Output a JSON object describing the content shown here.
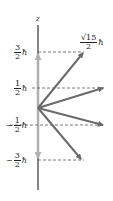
{
  "diagram": {
    "axis_label": "z",
    "hbar": "ħ",
    "levels": [
      {
        "sign": "",
        "num": "3",
        "den": "2"
      },
      {
        "sign": "",
        "num": "1",
        "den": "2"
      },
      {
        "sign": "−",
        "num": "1",
        "den": "2"
      },
      {
        "sign": "−",
        "num": "3",
        "den": "2"
      }
    ],
    "magnitude": {
      "num": "√15",
      "den": "2"
    },
    "colors": {
      "axis": "#333333",
      "vectors": "#6b6b6b",
      "projection": "#b0b0b0",
      "dashed": "#555555"
    }
  }
}
